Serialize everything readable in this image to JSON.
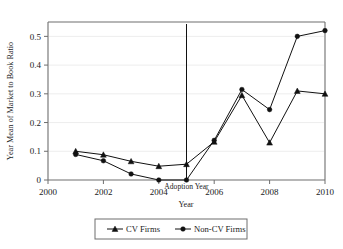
{
  "chart_data": {
    "type": "line",
    "title": "",
    "xlabel": "Year",
    "ylabel": "Year Mean of Market to Book Ratio",
    "x": [
      2001,
      2002,
      2003,
      2004,
      2005,
      2006,
      2007,
      2008,
      2009,
      2010
    ],
    "xlim": [
      2000,
      2010
    ],
    "ylim": [
      0,
      0.55
    ],
    "xticks": [
      "2000",
      "2002",
      "2004",
      "2006",
      "2008",
      "2010"
    ],
    "xtick_values": [
      2000,
      2002,
      2004,
      2006,
      2008,
      2010
    ],
    "yticks": [
      "0",
      "0.1",
      "0.2",
      "0.3",
      "0.4",
      "0.5"
    ],
    "ytick_values": [
      0,
      0.1,
      0.2,
      0.3,
      0.4,
      0.5
    ],
    "grid": "horizontal",
    "legend_position": "bottom-center",
    "series": [
      {
        "name": "CV Firms",
        "marker": "triangle",
        "color": "#111111",
        "values": [
          0.1,
          0.088,
          0.065,
          0.048,
          0.055,
          0.133,
          0.295,
          0.13,
          0.31,
          0.3
        ]
      },
      {
        "name": "Non-CV Firms",
        "marker": "circle",
        "color": "#111111",
        "values": [
          0.089,
          0.067,
          0.021,
          0.0,
          0.0,
          0.138,
          0.315,
          0.245,
          0.5,
          0.52
        ]
      }
    ],
    "annotations": [
      {
        "text": "Adoption Year",
        "x": 2005,
        "type": "vertical-reference-line"
      }
    ]
  },
  "legend": {
    "entries": [
      {
        "label": "CV Firms",
        "marker": "triangle-icon"
      },
      {
        "label": "Non-CV Firms",
        "marker": "circle-icon"
      }
    ]
  },
  "axes": {
    "y_title": "Year Mean of Market to Book Ratio",
    "x_title": "Year"
  }
}
